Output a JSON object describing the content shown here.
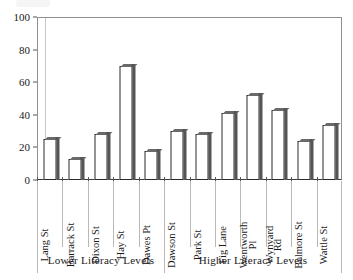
{
  "chart_data": {
    "type": "bar",
    "title": "",
    "subtitle": "",
    "xlabel": "",
    "ylabel": "",
    "ylim": [
      0,
      100
    ],
    "yticks": [
      0,
      20,
      40,
      60,
      80,
      100
    ],
    "grid": false,
    "legend": null,
    "categories": [
      "Lang St",
      "Barrack St",
      "Dixon St",
      "Hay St",
      "Dawes Pt",
      "Dawson St",
      "Park St",
      "Fig Lane",
      "Wentworth Pl",
      "Wynyard Rd",
      "Belmore St",
      "Wattle St"
    ],
    "category_label_lines": [
      [
        "Lang St"
      ],
      [
        "Barrack St"
      ],
      [
        "Dixon St"
      ],
      [
        "Hay St"
      ],
      [
        "Dawes Pt"
      ],
      [
        "Dawson St"
      ],
      [
        "Park St"
      ],
      [
        "Fig Lane"
      ],
      [
        "Wentworth",
        "Pl"
      ],
      [
        "Wynyard",
        "Rd"
      ],
      [
        "Belmore St"
      ],
      [
        "Wattle St"
      ]
    ],
    "values": [
      25,
      13,
      28,
      70,
      18,
      30,
      28,
      41,
      52,
      43,
      24,
      34
    ],
    "groups": [
      {
        "label": "Lower Literacy Levels",
        "start_index": 0,
        "end_index": 4
      },
      {
        "label": "Higher Literacy Levels",
        "start_index": 5,
        "end_index": 11
      }
    ],
    "colors": {
      "bar_fill": "#ffffff",
      "bar_outline": "#2b2b2b",
      "bar_shadow": "#555555",
      "axis": "#3a3a3a",
      "frame": "#8f8f8f",
      "text": "#1a1a1a"
    }
  }
}
